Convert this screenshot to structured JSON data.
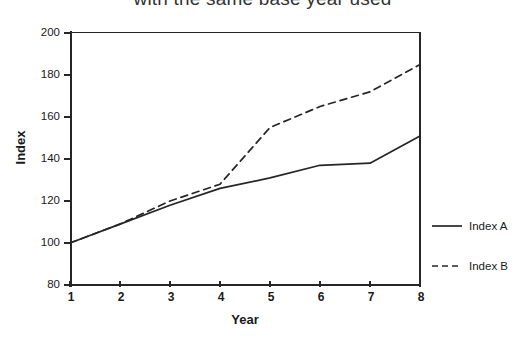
{
  "chart_data": {
    "type": "line",
    "title": "with the same base year used",
    "xlabel": "Year",
    "ylabel": "Index",
    "x": [
      1,
      2,
      3,
      4,
      5,
      6,
      7,
      8
    ],
    "xticklabels": [
      "1",
      "2",
      "3",
      "4",
      "5",
      "6",
      "7",
      "8"
    ],
    "yticks": [
      80,
      100,
      120,
      140,
      160,
      180,
      200
    ],
    "yticklabels": [
      "80",
      "100",
      "120",
      "140",
      "160",
      "180",
      "200"
    ],
    "xlim": [
      1,
      8
    ],
    "ylim": [
      80,
      200
    ],
    "grid": false,
    "legend_position": "right",
    "series": [
      {
        "name": "Index A",
        "style": "solid",
        "color": "#262626",
        "values": [
          100,
          109,
          118,
          126,
          131,
          137,
          138,
          151
        ]
      },
      {
        "name": "Index B",
        "style": "dashed",
        "color": "#262626",
        "values": [
          100,
          109,
          120,
          128,
          155,
          165,
          172,
          185
        ]
      }
    ]
  },
  "legend": {
    "items": [
      {
        "label": "Index A",
        "style": "solid"
      },
      {
        "label": "Index B",
        "style": "dashed"
      }
    ]
  }
}
